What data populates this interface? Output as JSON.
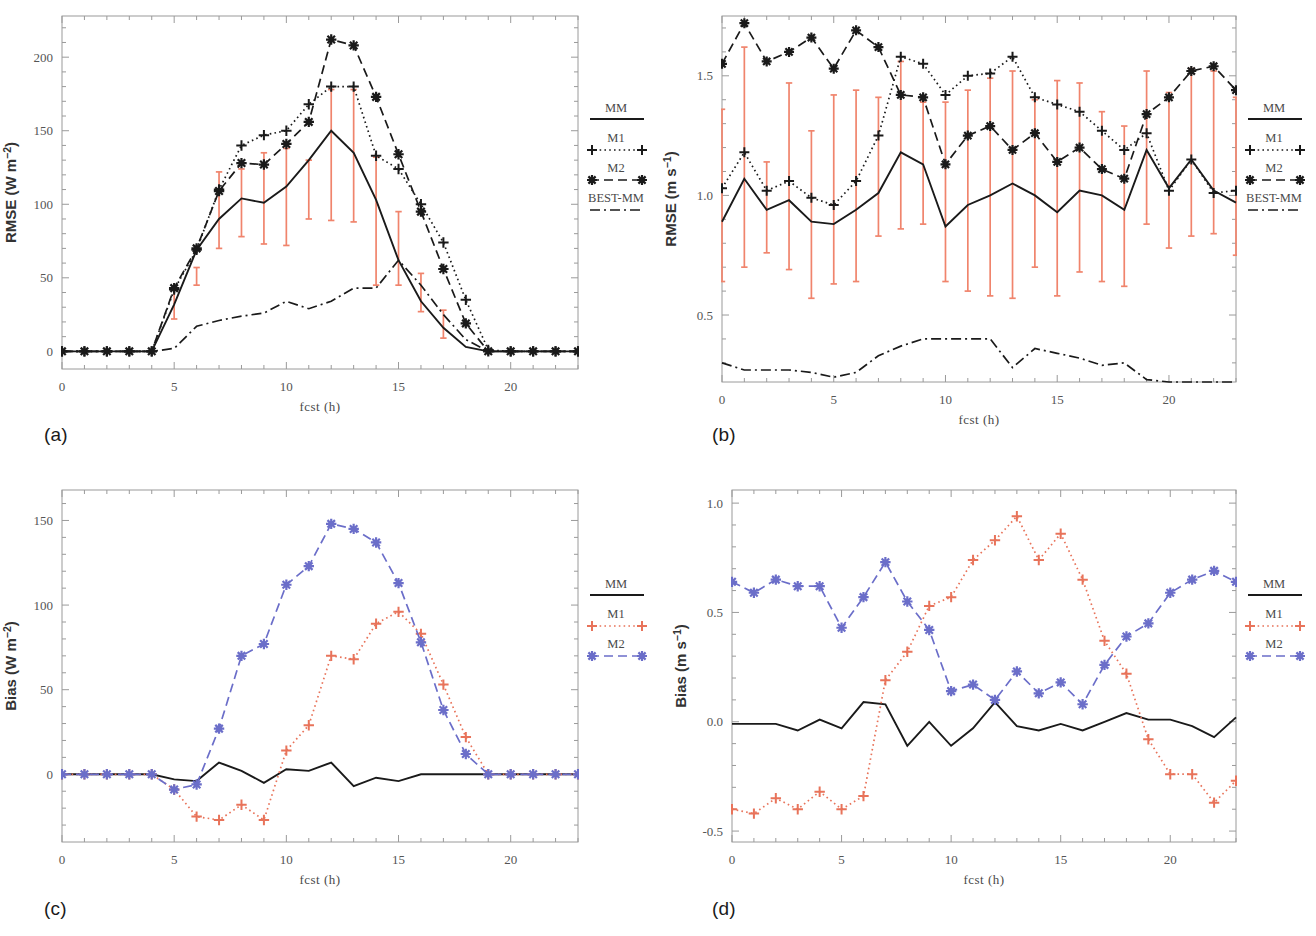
{
  "figure": {
    "panels": [
      {
        "tag": "(a)",
        "ylabel": "RMSE (W m⁻²)",
        "xlabel": "fcst (h)",
        "legend": {
          "title": "MM",
          "items": [
            "M1",
            "M2",
            "BEST-MM"
          ]
        },
        "yticks": [
          "0",
          "50",
          "100",
          "150",
          "200"
        ],
        "xticks": [
          "0",
          "5",
          "10",
          "15",
          "20"
        ]
      },
      {
        "tag": "(b)",
        "ylabel": "RMSE (m s⁻¹)",
        "xlabel": "fcst (h)",
        "legend": {
          "title": "MM",
          "items": [
            "M1",
            "M2",
            "BEST-MM"
          ]
        },
        "yticks": [
          "0.5",
          "1.0",
          "1.5"
        ],
        "xticks": [
          "0",
          "5",
          "10",
          "15",
          "20"
        ]
      },
      {
        "tag": "(c)",
        "ylabel": "Bias (W m⁻²)",
        "xlabel": "fcst (h)",
        "legend": {
          "title": "MM",
          "items": [
            "M1",
            "M2"
          ]
        },
        "yticks": [
          "0",
          "50",
          "100",
          "150"
        ],
        "xticks": [
          "0",
          "5",
          "10",
          "15",
          "20"
        ]
      },
      {
        "tag": "(d)",
        "ylabel": "Bias (m s⁻¹)",
        "xlabel": "fcst (h)",
        "legend": {
          "title": "MM",
          "items": [
            "M1",
            "M2"
          ]
        },
        "yticks": [
          "-0.5",
          "0.0",
          "0.5",
          "1.0"
        ],
        "xticks": [
          "0",
          "5",
          "10",
          "15",
          "20"
        ]
      }
    ],
    "colors": {
      "mm": "#1a1a1a",
      "m1_mono": "#1a1a1a",
      "m2_mono": "#1a1a1a",
      "best_mm": "#1a1a1a",
      "m1_color": "#e8735a",
      "m2_color": "#6b6ec9",
      "errorbar": "#f0846c",
      "frame": "#9a9a9a"
    }
  },
  "chart_data": [
    {
      "type": "line",
      "panel": "(a)",
      "title": "",
      "xlabel": "fcst (h)",
      "ylabel": "RMSE (W m⁻²)",
      "x": [
        0,
        1,
        2,
        3,
        4,
        5,
        6,
        7,
        8,
        9,
        10,
        11,
        12,
        13,
        14,
        15,
        16,
        17,
        18,
        19,
        20,
        21,
        22,
        23
      ],
      "xlim": [
        0,
        23
      ],
      "ylim": [
        -12,
        228
      ],
      "grid": false,
      "legend_position": "right-outside",
      "series": [
        {
          "name": "MM",
          "style": "solid",
          "marker": "none",
          "values": [
            0,
            0,
            0,
            0,
            0,
            32,
            69,
            90,
            104,
            101,
            112,
            130,
            150,
            135,
            103,
            62,
            34,
            16,
            3,
            0,
            0,
            0,
            0,
            0
          ]
        },
        {
          "name": "M1",
          "style": "dotted",
          "marker": "plus",
          "values": [
            0,
            0,
            0,
            0,
            0,
            42,
            69,
            110,
            140,
            147,
            150,
            168,
            180,
            180,
            133,
            124,
            100,
            74,
            35,
            1,
            0,
            0,
            0,
            0
          ]
        },
        {
          "name": "M2",
          "style": "dashed",
          "marker": "star",
          "values": [
            0,
            0,
            0,
            0,
            0,
            43,
            70,
            109,
            128,
            127,
            141,
            156,
            212,
            208,
            173,
            134,
            95,
            56,
            19,
            0,
            0,
            0,
            0,
            0
          ]
        },
        {
          "name": "BEST-MM",
          "style": "dashdot",
          "marker": "none",
          "values": [
            0,
            0,
            0,
            0,
            0,
            2,
            17,
            21,
            24,
            26,
            34,
            29,
            34,
            43,
            43,
            62,
            45,
            25,
            8,
            0,
            0,
            0,
            0,
            0
          ]
        }
      ],
      "errorbars": {
        "series": "MM",
        "color": "#f0846c",
        "x": [
          5,
          6,
          7,
          8,
          9,
          10,
          11,
          12,
          13,
          14,
          15,
          16,
          17
        ],
        "lower": [
          22,
          45,
          70,
          78,
          73,
          72,
          90,
          89,
          88,
          45,
          45,
          27,
          9
        ],
        "upper": [
          42,
          57,
          122,
          124,
          135,
          138,
          130,
          178,
          178,
          132,
          95,
          53,
          28
        ]
      }
    },
    {
      "type": "line",
      "panel": "(b)",
      "title": "",
      "xlabel": "fcst (h)",
      "ylabel": "RMSE (m s⁻¹)",
      "x": [
        0,
        1,
        2,
        3,
        4,
        5,
        6,
        7,
        8,
        9,
        10,
        11,
        12,
        13,
        14,
        15,
        16,
        17,
        18,
        19,
        20,
        21,
        22,
        23
      ],
      "xlim": [
        0,
        23
      ],
      "ylim": [
        0.22,
        1.75
      ],
      "grid": false,
      "legend_position": "right-outside",
      "series": [
        {
          "name": "MM",
          "style": "solid",
          "marker": "none",
          "values": [
            0.89,
            1.07,
            0.94,
            0.98,
            0.89,
            0.88,
            0.94,
            1.01,
            1.18,
            1.13,
            0.87,
            0.96,
            1.0,
            1.05,
            1.0,
            0.93,
            1.02,
            1.0,
            0.94,
            1.19,
            1.03,
            1.15,
            1.02,
            0.97
          ]
        },
        {
          "name": "M1",
          "style": "dotted",
          "marker": "plus",
          "values": [
            1.03,
            1.18,
            1.02,
            1.06,
            0.99,
            0.96,
            1.06,
            1.25,
            1.58,
            1.55,
            1.42,
            1.5,
            1.51,
            1.58,
            1.41,
            1.38,
            1.35,
            1.27,
            1.19,
            1.26,
            1.02,
            1.15,
            1.01,
            1.02
          ]
        },
        {
          "name": "M2",
          "style": "dashed",
          "marker": "star",
          "values": [
            1.55,
            1.72,
            1.56,
            1.6,
            1.66,
            1.53,
            1.69,
            1.62,
            1.42,
            1.41,
            1.13,
            1.25,
            1.29,
            1.19,
            1.26,
            1.14,
            1.2,
            1.11,
            1.07,
            1.34,
            1.41,
            1.52,
            1.54,
            1.44
          ]
        },
        {
          "name": "BEST-MM",
          "style": "dashdot",
          "marker": "none",
          "values": [
            0.3,
            0.27,
            0.27,
            0.27,
            0.26,
            0.24,
            0.26,
            0.33,
            0.37,
            0.4,
            0.4,
            0.4,
            0.4,
            0.28,
            0.36,
            0.34,
            0.32,
            0.29,
            0.3,
            0.23,
            0.22,
            0.22,
            0.22,
            0.22
          ]
        }
      ],
      "errorbars": {
        "series": "MM",
        "color": "#f0846c",
        "x": [
          0,
          1,
          2,
          3,
          4,
          5,
          6,
          7,
          8,
          9,
          10,
          11,
          12,
          13,
          14,
          15,
          16,
          17,
          18,
          19,
          20,
          21,
          22,
          23
        ],
        "lower": [
          0.64,
          0.7,
          0.76,
          0.69,
          0.57,
          0.63,
          0.64,
          0.83,
          0.86,
          0.88,
          0.64,
          0.6,
          0.58,
          0.57,
          0.7,
          0.58,
          0.68,
          0.64,
          0.62,
          0.88,
          0.78,
          0.83,
          0.84,
          0.75
        ],
        "upper": [
          1.36,
          1.62,
          1.14,
          1.47,
          1.27,
          1.42,
          1.44,
          1.41,
          1.56,
          1.39,
          1.39,
          1.44,
          1.49,
          1.52,
          1.4,
          1.48,
          1.47,
          1.35,
          1.29,
          1.52,
          1.43,
          1.53,
          1.52,
          1.41
        ]
      }
    },
    {
      "type": "line",
      "panel": "(c)",
      "title": "",
      "xlabel": "fcst (h)",
      "ylabel": "Bias (W m⁻²)",
      "x": [
        0,
        1,
        2,
        3,
        4,
        5,
        6,
        7,
        8,
        9,
        10,
        11,
        12,
        13,
        14,
        15,
        16,
        17,
        18,
        19,
        20,
        21,
        22,
        23
      ],
      "xlim": [
        0,
        23
      ],
      "ylim": [
        -40,
        168
      ],
      "grid": false,
      "legend_position": "right-outside",
      "series": [
        {
          "name": "MM",
          "style": "solid",
          "marker": "none",
          "values": [
            0,
            0,
            0,
            0,
            0,
            -3,
            -4,
            7,
            2,
            -5,
            3,
            2,
            7,
            -7,
            -2,
            -4,
            0,
            0,
            0,
            0,
            0,
            0,
            0,
            0
          ]
        },
        {
          "name": "M1",
          "style": "dotted",
          "marker": "plus",
          "values": [
            0,
            0,
            0,
            0,
            0,
            -9,
            -25,
            -27,
            -18,
            -27,
            14,
            29,
            70,
            68,
            89,
            96,
            83,
            53,
            22,
            0,
            0,
            0,
            0,
            0
          ]
        },
        {
          "name": "M2",
          "style": "dashed",
          "marker": "star",
          "values": [
            0,
            0,
            0,
            0,
            0,
            -9,
            -6,
            27,
            70,
            77,
            112,
            123,
            148,
            145,
            137,
            113,
            78,
            38,
            12,
            0,
            0,
            0,
            0,
            0
          ]
        }
      ]
    },
    {
      "type": "line",
      "panel": "(d)",
      "title": "",
      "xlabel": "fcst (h)",
      "ylabel": "Bias (m s⁻¹)",
      "x": [
        0,
        1,
        2,
        3,
        4,
        5,
        6,
        7,
        8,
        9,
        10,
        11,
        12,
        13,
        14,
        15,
        16,
        17,
        18,
        19,
        20,
        21,
        22,
        23
      ],
      "xlim": [
        0,
        23
      ],
      "ylim": [
        -0.55,
        1.06
      ],
      "grid": false,
      "legend_position": "right-outside",
      "series": [
        {
          "name": "MM",
          "style": "solid",
          "marker": "none",
          "values": [
            -0.01,
            -0.01,
            -0.01,
            -0.04,
            0.01,
            -0.03,
            0.09,
            0.08,
            -0.11,
            0.0,
            -0.11,
            -0.03,
            0.09,
            -0.02,
            -0.04,
            -0.01,
            -0.04,
            0.0,
            0.04,
            0.01,
            0.01,
            -0.02,
            -0.07,
            0.02
          ]
        },
        {
          "name": "M1",
          "style": "dotted",
          "marker": "plus",
          "values": [
            -0.4,
            -0.42,
            -0.35,
            -0.4,
            -0.32,
            -0.4,
            -0.34,
            0.19,
            0.32,
            0.53,
            0.57,
            0.74,
            0.83,
            0.94,
            0.74,
            0.86,
            0.65,
            0.37,
            0.22,
            -0.08,
            -0.24,
            -0.24,
            -0.37,
            -0.27
          ]
        },
        {
          "name": "M2",
          "style": "dashed",
          "marker": "star",
          "values": [
            0.64,
            0.59,
            0.65,
            0.62,
            0.62,
            0.43,
            0.57,
            0.73,
            0.55,
            0.42,
            0.14,
            0.17,
            0.1,
            0.23,
            0.13,
            0.18,
            0.08,
            0.26,
            0.39,
            0.45,
            0.59,
            0.65,
            0.69,
            0.64
          ]
        }
      ]
    }
  ]
}
